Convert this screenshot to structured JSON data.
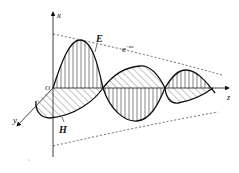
{
  "diagram": {
    "axes": {
      "x_label": "x",
      "y_label": "y",
      "z_label": "z",
      "origin_label": "O"
    },
    "fields": {
      "electric_label": "E",
      "magnetic_label": "H"
    },
    "envelope": {
      "base": "e",
      "exponent": "−αz"
    },
    "colors": {
      "stroke": "#111111",
      "hatch": "#333333",
      "envelope": "#444444",
      "background": "#ffffff"
    }
  }
}
